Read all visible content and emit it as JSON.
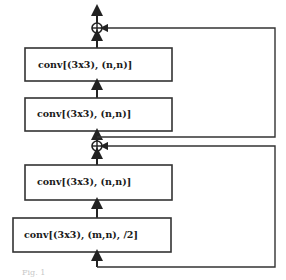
{
  "diagram": {
    "type": "residual-block-flowchart",
    "blocks": [
      {
        "id": "conv1",
        "label": "conv[(3x3), (n,n)]"
      },
      {
        "id": "conv2",
        "label": "conv[(3x3), (n,n)]"
      },
      {
        "id": "conv3",
        "label": "conv[(3x3), (n,n)]"
      },
      {
        "id": "conv4",
        "label": "conv[(3x3), (m,n), /2]"
      }
    ],
    "adders": [
      {
        "id": "add-top",
        "symbol": "⊕"
      },
      {
        "id": "add-middle",
        "symbol": "⊕"
      }
    ],
    "skip_connections": [
      {
        "from": "below conv4",
        "to": "add-middle"
      },
      {
        "from": "add-middle",
        "to": "add-top"
      }
    ],
    "colors": {
      "stroke": "#222222",
      "background": "#ffffff"
    },
    "caption": "Fig. 1"
  }
}
